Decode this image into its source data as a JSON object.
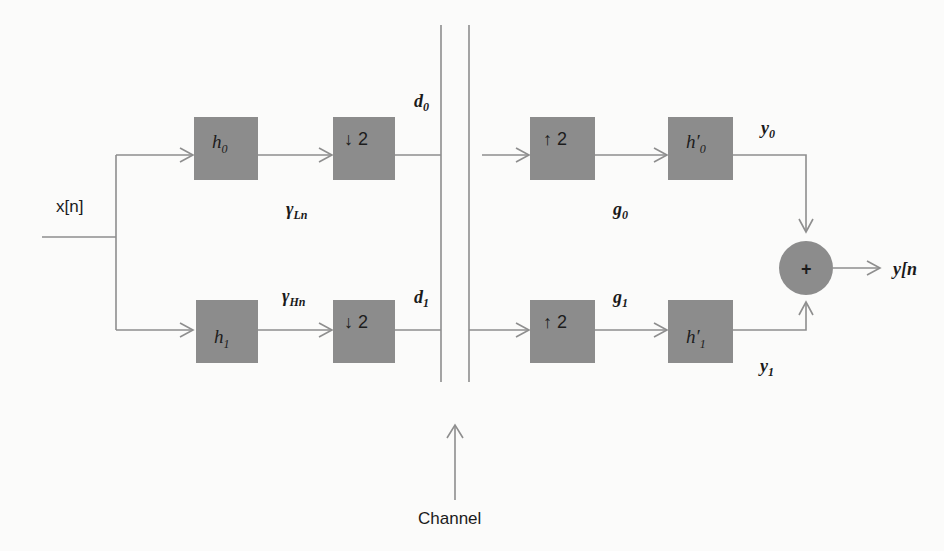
{
  "diagram": {
    "colors": {
      "block_fill": "#8c8c8c",
      "wire": "#8e8e8e",
      "background": "#fbfbfa",
      "text": "#1a1a1a"
    },
    "input": {
      "label": "x[n]"
    },
    "output": {
      "label": "y[n"
    },
    "channel": {
      "label": "Channel"
    },
    "analysis": {
      "blocks": [
        {
          "id": "h0",
          "label": "h",
          "sub": "0",
          "prime": ""
        },
        {
          "id": "down0",
          "label": "↓ 2",
          "sub": "",
          "prime": ""
        },
        {
          "id": "h1",
          "label": "h",
          "sub": "1",
          "prime": ""
        },
        {
          "id": "down1",
          "label": "↓ 2",
          "sub": "",
          "prime": ""
        }
      ],
      "signals": [
        {
          "id": "gamma_Ln",
          "label": "γ",
          "sub": "Ln"
        },
        {
          "id": "gamma_Hn",
          "label": "γ",
          "sub": "Hn"
        },
        {
          "id": "d0",
          "label": "d",
          "sub": "0"
        },
        {
          "id": "d1",
          "label": "d",
          "sub": "1"
        }
      ]
    },
    "synthesis": {
      "blocks": [
        {
          "id": "up0",
          "label": "↑ 2",
          "sub": "",
          "prime": ""
        },
        {
          "id": "hp0",
          "label": "h",
          "sub": "0",
          "prime": "′"
        },
        {
          "id": "up1",
          "label": "↑ 2",
          "sub": "",
          "prime": ""
        },
        {
          "id": "hp1",
          "label": "h",
          "sub": "1",
          "prime": "′"
        }
      ],
      "signals": [
        {
          "id": "g0",
          "label": "g",
          "sub": "0"
        },
        {
          "id": "g1",
          "label": "g",
          "sub": "1"
        },
        {
          "id": "y0",
          "label": "y",
          "sub": "0"
        },
        {
          "id": "y1",
          "label": "y",
          "sub": "1"
        }
      ],
      "adder": {
        "id": "sum",
        "label": "+"
      }
    },
    "labels": {
      "h0_base": "h",
      "h0_sub": "0",
      "h1_base": "h",
      "h1_sub": "1",
      "down_2": "↓ 2",
      "up_2": "↑ 2",
      "hp0_base": "h",
      "hp0_prime": "′",
      "hp0_sub": "0",
      "hp1_base": "h",
      "hp1_prime": "′",
      "hp1_sub": "1",
      "gamma": "γ",
      "gamma_L_sub": "Ln",
      "gamma_H_sub": "Hn",
      "d_base": "d",
      "d0_sub": "0",
      "d1_sub": "1",
      "g_base": "g",
      "g0_sub": "0",
      "g1_sub": "1",
      "y_base": "y",
      "y0_sub": "0",
      "y1_sub": "1",
      "plus": "+",
      "x_of_n": "x[n]",
      "y_of_n": "y[n",
      "channel": "Channel"
    }
  }
}
